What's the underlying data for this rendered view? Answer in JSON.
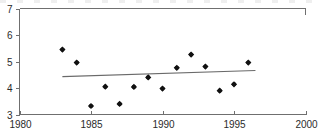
{
  "chart_data": {
    "type": "scatter",
    "title": "",
    "subtitle": "",
    "xlabel": "",
    "ylabel": "",
    "xlim": [
      1980,
      2000
    ],
    "ylim": [
      3,
      7
    ],
    "grid": false,
    "legend": null,
    "x_ticks": [
      1980,
      1985,
      1990,
      1995,
      2000
    ],
    "x_tick_labels": [
      "1980",
      "1985",
      "1990",
      "1995",
      "2000"
    ],
    "y_ticks": [
      3,
      4,
      5,
      6,
      7
    ],
    "y_tick_labels": [
      "3",
      "4",
      "5",
      "6",
      "7"
    ],
    "marker_style": "filled-diamond",
    "marker_color": "#111111",
    "axis_color": "#6f6f6f",
    "series": [
      {
        "name": "observations",
        "type": "scatter",
        "x": [
          1983,
          1984,
          1985,
          1986,
          1987,
          1988,
          1989,
          1990,
          1991,
          1992,
          1993,
          1994,
          1995,
          1996
        ],
        "y": [
          5.45,
          4.96,
          3.32,
          4.05,
          3.4,
          4.04,
          4.4,
          3.98,
          4.76,
          5.26,
          4.81,
          3.9,
          4.14,
          4.96
        ]
      },
      {
        "name": "trend",
        "type": "line",
        "x": [
          1983.0,
          1996.5
        ],
        "y": [
          4.43,
          4.66
        ]
      }
    ]
  },
  "annotations": {
    "top_edge_artifact": "partial cropped text row above plot"
  }
}
